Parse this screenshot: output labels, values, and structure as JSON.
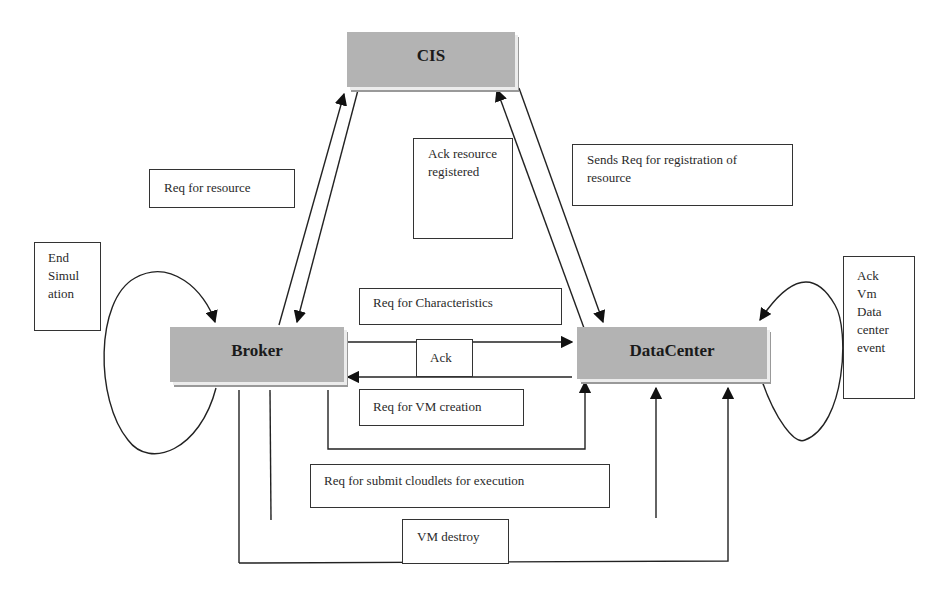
{
  "diagram": {
    "type": "CloudSim entity interaction flow",
    "entities": {
      "cis": "CIS",
      "broker": "Broker",
      "datacenter": "DataCenter"
    },
    "labels": {
      "req_for_resource": "Req for  resource",
      "ack_resource_registered": "Ack resource registered",
      "sends_req_registration": "Sends Req for  registration of resource",
      "end_simulation": "End Simul ation",
      "req_for_characteristics": "Req for Characteristics",
      "ack": "Ack",
      "req_for_vm_creation": "Req for VM creation",
      "req_submit_cloudlets": "Req for submit cloudlets for execution",
      "vm_destroy": "VM destroy",
      "ack_vm_datacenter_event": "Ack Vm Data center event"
    },
    "colors": {
      "entity_fill": "#b3b3b3",
      "line": "#222222"
    }
  }
}
